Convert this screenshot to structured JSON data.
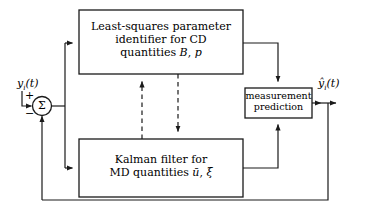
{
  "diagram": {
    "stroke_color": "#1a1a1a",
    "background_color": "#ffffff",
    "blocks": [
      {
        "id": "ls-identifier",
        "lines": [
          "Least-squares parameter",
          "identifier for CD",
          "quantities B, p"
        ],
        "line1": "Least-squares parameter",
        "line2": "identifier for CD",
        "line3_prefix": "quantities ",
        "line3_sym1": "B",
        "line3_sep": ", ",
        "line3_sym2": "p"
      },
      {
        "id": "kalman-filter",
        "lines": [
          "Kalman filter for",
          "MD quantities ū, ξ"
        ],
        "line1": "Kalman filter for",
        "line2_prefix": "MD quantities ",
        "line2_sym1": "ū",
        "line2_sep": ", ",
        "line2_sym2": "ξ"
      },
      {
        "id": "measurement-prediction",
        "lines": [
          "measurement",
          "prediction"
        ],
        "line1": "measurement",
        "line2": "prediction"
      }
    ],
    "signals": {
      "input_label_y": "y",
      "input_label_sub": "i",
      "input_label_arg": "(t)",
      "input_label_full": "y_i(t)",
      "output_label_y": "ŷ",
      "output_label_sub": "i",
      "output_label_arg": "(t)",
      "output_label_full": "ŷ_i(t)",
      "plus_sign": "+",
      "minus_sign": "−",
      "summation_glyph": "Σ"
    }
  }
}
